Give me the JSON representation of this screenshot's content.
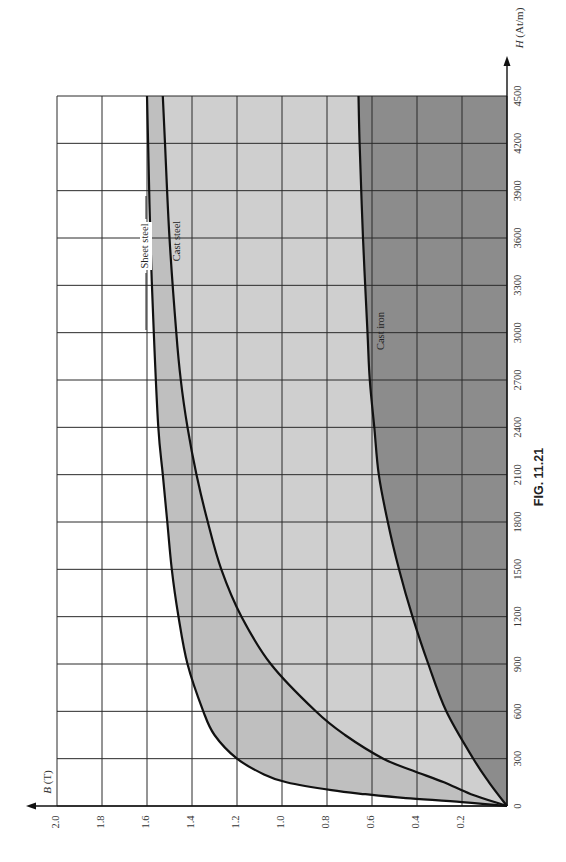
{
  "figure": {
    "caption": "FIG. 11.21"
  },
  "colors": {
    "region_sheet_steel": "#bfbfbf",
    "region_cast_steel": "#cfcfcf",
    "region_cast_iron": "#8c8c8c",
    "region_above": "#ffffff",
    "grid": "#2a2a2a",
    "curve": "#111111"
  },
  "chart_data": {
    "type": "line",
    "title": "FIG. 11.21",
    "orientation": "rotated 90 degrees counter-clockwise (H axis runs upward along right edge, B axis runs leftward along bottom)",
    "xlabel": "H (At/m)",
    "ylabel": "B (T)",
    "xlim": [
      0,
      4500
    ],
    "ylim": [
      0,
      2.0
    ],
    "x_ticks": [
      0,
      300,
      600,
      900,
      1200,
      1500,
      1800,
      2100,
      2400,
      2700,
      3000,
      3300,
      3600,
      3900,
      4200,
      4500
    ],
    "y_ticks": [
      0.2,
      0.4,
      0.6,
      0.8,
      1.0,
      1.2,
      1.4,
      1.6,
      1.8,
      2.0
    ],
    "x_tick_labels": [
      "0",
      "300",
      "600",
      "900",
      "1200",
      "1500",
      "1800",
      "2100",
      "2400",
      "2700",
      "3000",
      "3300",
      "3600",
      "3900",
      "4200",
      "4500"
    ],
    "y_tick_labels": [
      "0.2",
      "0.4",
      "0.6",
      "0.8",
      "1.0",
      "1.2",
      "1.4",
      "1.6",
      "1.8",
      "2.0"
    ],
    "grid": true,
    "legend": "inline labels on curves",
    "series": [
      {
        "name": "Sheet steel",
        "x": [
          0,
          25,
          50,
          75,
          100,
          150,
          200,
          300,
          450,
          600,
          900,
          1200,
          1500,
          1800,
          2100,
          2400,
          3000,
          3600,
          4200,
          4500
        ],
        "values": [
          0,
          0.2,
          0.45,
          0.63,
          0.78,
          0.98,
          1.08,
          1.2,
          1.3,
          1.35,
          1.42,
          1.46,
          1.49,
          1.51,
          1.53,
          1.55,
          1.57,
          1.585,
          1.595,
          1.6
        ]
      },
      {
        "name": "Cast steel",
        "x": [
          0,
          75,
          150,
          225,
          300,
          450,
          600,
          900,
          1200,
          1500,
          1800,
          2100,
          2400,
          2700,
          3000,
          3600,
          4200,
          4500
        ],
        "values": [
          0,
          0.16,
          0.28,
          0.42,
          0.55,
          0.72,
          0.85,
          1.05,
          1.18,
          1.27,
          1.33,
          1.38,
          1.42,
          1.45,
          1.47,
          1.5,
          1.52,
          1.53
        ]
      },
      {
        "name": "Cast iron",
        "x": [
          0,
          150,
          300,
          600,
          900,
          1200,
          1500,
          1800,
          2100,
          2400,
          2700,
          3000,
          3600,
          4200,
          4500
        ],
        "values": [
          0,
          0.08,
          0.15,
          0.27,
          0.35,
          0.42,
          0.48,
          0.53,
          0.57,
          0.59,
          0.61,
          0.62,
          0.64,
          0.655,
          0.66
        ]
      }
    ]
  },
  "labels": {
    "x_axis": "H (At/m)",
    "y_axis": "B (T)",
    "sheet_steel": "Sheet steel",
    "cast_steel": "Cast steel",
    "cast_iron": "Cast iron"
  }
}
